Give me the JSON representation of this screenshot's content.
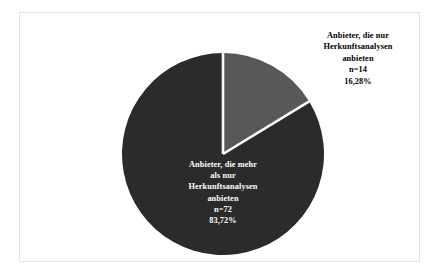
{
  "figure": {
    "background_color": "#ffffff",
    "frame_color": "#e3e3e3"
  },
  "chart_data": {
    "type": "pie",
    "title": "",
    "subtitle": "",
    "xlabel": "",
    "ylabel": "",
    "grid": false,
    "legend_position": "none",
    "total_n": 86,
    "start_angle_deg": 0,
    "direction": "clockwise",
    "categories": [
      "Anbieter, die nur Herkunftsanalysen anbieten",
      "Anbieter, die mehr als nur Herkunftsanalysen anbieten"
    ],
    "values": [
      14,
      72
    ],
    "percentages": [
      16.28,
      83.72
    ],
    "colors": [
      "#58585a",
      "#2b2b2b"
    ],
    "slice_separator_color": "#ffffff",
    "slices": [
      {
        "name": "nur-herkunftsanalysen",
        "count": 14,
        "percent": 16.28,
        "percent_label": "16,28%",
        "count_label": "n=14",
        "color": "#58585a",
        "label_color": "#000000",
        "label_placement": "outside"
      },
      {
        "name": "mehr-als-nur-herkunftsanalysen",
        "count": 72,
        "percent": 83.72,
        "percent_label": "83,72%",
        "count_label": "n=72",
        "color": "#2b2b2b",
        "label_color": "#ffffff",
        "label_placement": "inside"
      }
    ]
  },
  "labels": {
    "only_origin": {
      "lines": [
        "Anbieter, die nur",
        "Herkunftsanalysen",
        "anbieten",
        "n=14",
        "16,28%"
      ]
    },
    "more_than_origin": {
      "lines": [
        "Anbieter, die mehr",
        "als nur",
        "Herkunftsanalysen",
        "anbieten",
        "n=72",
        "83,72%"
      ]
    }
  }
}
